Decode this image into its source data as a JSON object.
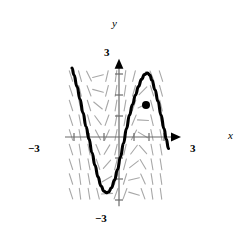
{
  "figure": {
    "kind": "slope-field-with-solution-curve",
    "width": 242,
    "height": 240,
    "background_color": "#ffffff"
  },
  "axes": {
    "x_axis_label": "x",
    "y_axis_label": "y",
    "origin_px": [
      119,
      137
    ],
    "x_unit_px": 15,
    "y_unit_px": 21,
    "x_range": [
      -3.6,
      3.6
    ],
    "y_range": [
      -3.3,
      3.3
    ],
    "axis_color": "#6b6b6b",
    "x_tick_labels": [
      {
        "text": "−3",
        "value": -3
      },
      {
        "text": "3",
        "value": 3
      }
    ],
    "y_tick_labels": [
      {
        "text": "3",
        "value": 3
      },
      {
        "text": "−3",
        "value": -3
      }
    ],
    "x_tick_values": [
      -3,
      -2,
      -1,
      1,
      2,
      3
    ],
    "y_tick_values": [
      -3,
      -2,
      -1,
      1,
      2,
      3
    ],
    "arrowheads": [
      "x-positive",
      "y-positive"
    ],
    "grid": false
  },
  "slope_field": {
    "color": "#a8a8a8",
    "segment_length_px": 11,
    "stroke_width": 1.1,
    "columns_x": [
      -3.2,
      -2.6,
      -2.0,
      -1.4,
      -0.8,
      -0.2,
      0.4,
      1.0,
      1.6,
      2.2,
      2.8
    ],
    "rows_y": [
      2.9,
      2.2,
      1.5,
      0.8,
      0.1,
      -0.6,
      -1.3,
      -2.0,
      -2.7
    ],
    "description": "short gray tick segments whose angle varies smoothly; near vertical at the left and right margins, flattening toward horizontal along the trough and crest of the solution curve"
  },
  "solution_curve": {
    "color": "#000000",
    "stroke_width": 3.1,
    "points": [
      [
        -6.27,
        3.28
      ],
      [
        -6.0,
        2.95
      ],
      [
        -5.6,
        2.4
      ],
      [
        -5.2,
        1.8
      ],
      [
        -4.8,
        1.15
      ],
      [
        -4.4,
        0.5
      ],
      [
        -4.0,
        -0.1
      ],
      [
        -3.6,
        -0.75
      ],
      [
        -3.2,
        -1.35
      ],
      [
        -2.8,
        -1.9
      ],
      [
        -2.4,
        -2.33
      ],
      [
        -2.0,
        -2.58
      ],
      [
        -1.7,
        -2.65
      ],
      [
        -1.4,
        -2.62
      ],
      [
        -1.0,
        -2.42
      ],
      [
        -0.6,
        -2.05
      ],
      [
        -0.2,
        -1.55
      ],
      [
        0.2,
        -0.95
      ],
      [
        0.6,
        -0.3
      ],
      [
        1.0,
        0.4
      ],
      [
        1.4,
        1.05
      ],
      [
        1.8,
        1.55
      ],
      [
        2.2,
        2.0
      ],
      [
        2.6,
        2.4
      ],
      [
        3.0,
        2.75
      ],
      [
        3.4,
        2.97
      ],
      [
        3.8,
        3.05
      ],
      [
        4.1,
        2.95
      ],
      [
        4.4,
        2.7
      ],
      [
        4.8,
        2.25
      ],
      [
        5.2,
        1.7
      ],
      [
        5.6,
        1.05
      ],
      [
        6.0,
        0.4
      ],
      [
        6.3,
        -0.1
      ],
      [
        6.6,
        -0.55
      ]
    ]
  },
  "marked_point": {
    "label": "initial-condition-point",
    "position_px": [
      146,
      105
    ],
    "value": [
      1.8,
      1.5
    ],
    "color": "#000000",
    "radius_px": 4
  }
}
